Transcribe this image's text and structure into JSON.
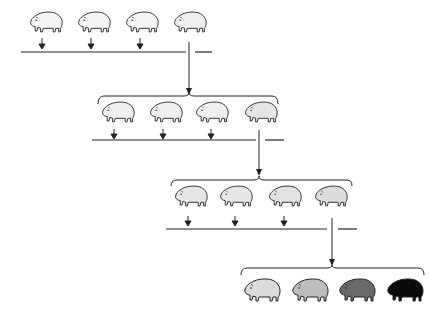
{
  "diagram": {
    "generations": [
      {
        "index": 1,
        "animals": [
          {
            "shade": "pale",
            "fill": "#f4f4f4",
            "selected": false
          },
          {
            "shade": "pale",
            "fill": "#f4f4f4",
            "selected": false
          },
          {
            "shade": "pale",
            "fill": "#f4f4f4",
            "selected": false
          },
          {
            "shade": "pale",
            "fill": "#eeeeee",
            "selected": true
          }
        ]
      },
      {
        "index": 2,
        "animals": [
          {
            "shade": "pale",
            "fill": "#efefef",
            "selected": false
          },
          {
            "shade": "pale",
            "fill": "#efefef",
            "selected": false
          },
          {
            "shade": "pale",
            "fill": "#efefef",
            "selected": false
          },
          {
            "shade": "light",
            "fill": "#e6e6e6",
            "selected": true
          }
        ]
      },
      {
        "index": 3,
        "animals": [
          {
            "shade": "light",
            "fill": "#e6e6e6",
            "selected": false
          },
          {
            "shade": "light",
            "fill": "#e6e6e6",
            "selected": false
          },
          {
            "shade": "light",
            "fill": "#e2e2e2",
            "selected": false
          },
          {
            "shade": "light",
            "fill": "#dddddd",
            "selected": true
          }
        ]
      },
      {
        "index": 4,
        "animals": [
          {
            "shade": "light",
            "fill": "#dcdcdc",
            "selected": false
          },
          {
            "shade": "medium",
            "fill": "#bdbdbd",
            "selected": false
          },
          {
            "shade": "dark",
            "fill": "#6a6a6a",
            "selected": false
          },
          {
            "shade": "black",
            "fill": "#0a0a0a",
            "selected": false
          }
        ]
      }
    ],
    "colors": {
      "line": "#222222",
      "background": "#ffffff"
    }
  }
}
